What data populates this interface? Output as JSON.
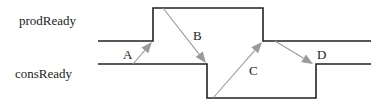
{
  "signals": [
    {
      "name": "prodReady",
      "label": "prodReady",
      "levels": [
        "low",
        "high",
        "low"
      ]
    },
    {
      "name": "consReady",
      "label": "consReady",
      "levels": [
        "high",
        "low",
        "high"
      ]
    }
  ],
  "events": [
    {
      "label": "A",
      "from": "consReady",
      "to": "prodReady",
      "description": "consReady high triggers prodReady rise"
    },
    {
      "label": "B",
      "from": "prodReady",
      "to": "consReady",
      "description": "prodReady high triggers consReady fall"
    },
    {
      "label": "C",
      "from": "consReady",
      "to": "prodReady",
      "description": "consReady low triggers prodReady fall"
    },
    {
      "label": "D",
      "from": "prodReady",
      "to": "consReady",
      "description": "prodReady low triggers consReady rise"
    }
  ],
  "colors": {
    "wave": "#222222",
    "arrow": "#9a9a9a",
    "text": "#222222"
  }
}
